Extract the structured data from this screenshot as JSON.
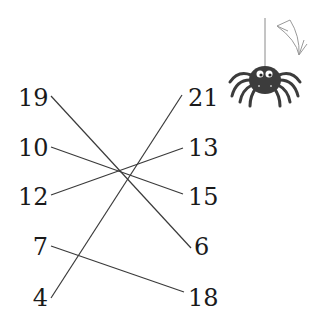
{
  "left_column": [
    {
      "value": "19",
      "y": 98
    },
    {
      "value": "10",
      "y": 148
    },
    {
      "value": "12",
      "y": 197
    },
    {
      "value": "7",
      "y": 247
    },
    {
      "value": "4",
      "y": 298
    }
  ],
  "right_column": [
    {
      "value": "21",
      "y": 98
    },
    {
      "value": "13",
      "y": 148
    },
    {
      "value": "15",
      "y": 197
    },
    {
      "value": "6",
      "y": 247
    },
    {
      "value": "18",
      "y": 298
    }
  ],
  "connections": [
    {
      "from": "19",
      "to": "6"
    },
    {
      "from": "10",
      "to": "15"
    },
    {
      "from": "12",
      "to": "13"
    },
    {
      "from": "7",
      "to": "18"
    },
    {
      "from": "4",
      "to": "21"
    }
  ],
  "decoration": {
    "spider": "spider-on-thread",
    "web": "cobweb-corner"
  }
}
